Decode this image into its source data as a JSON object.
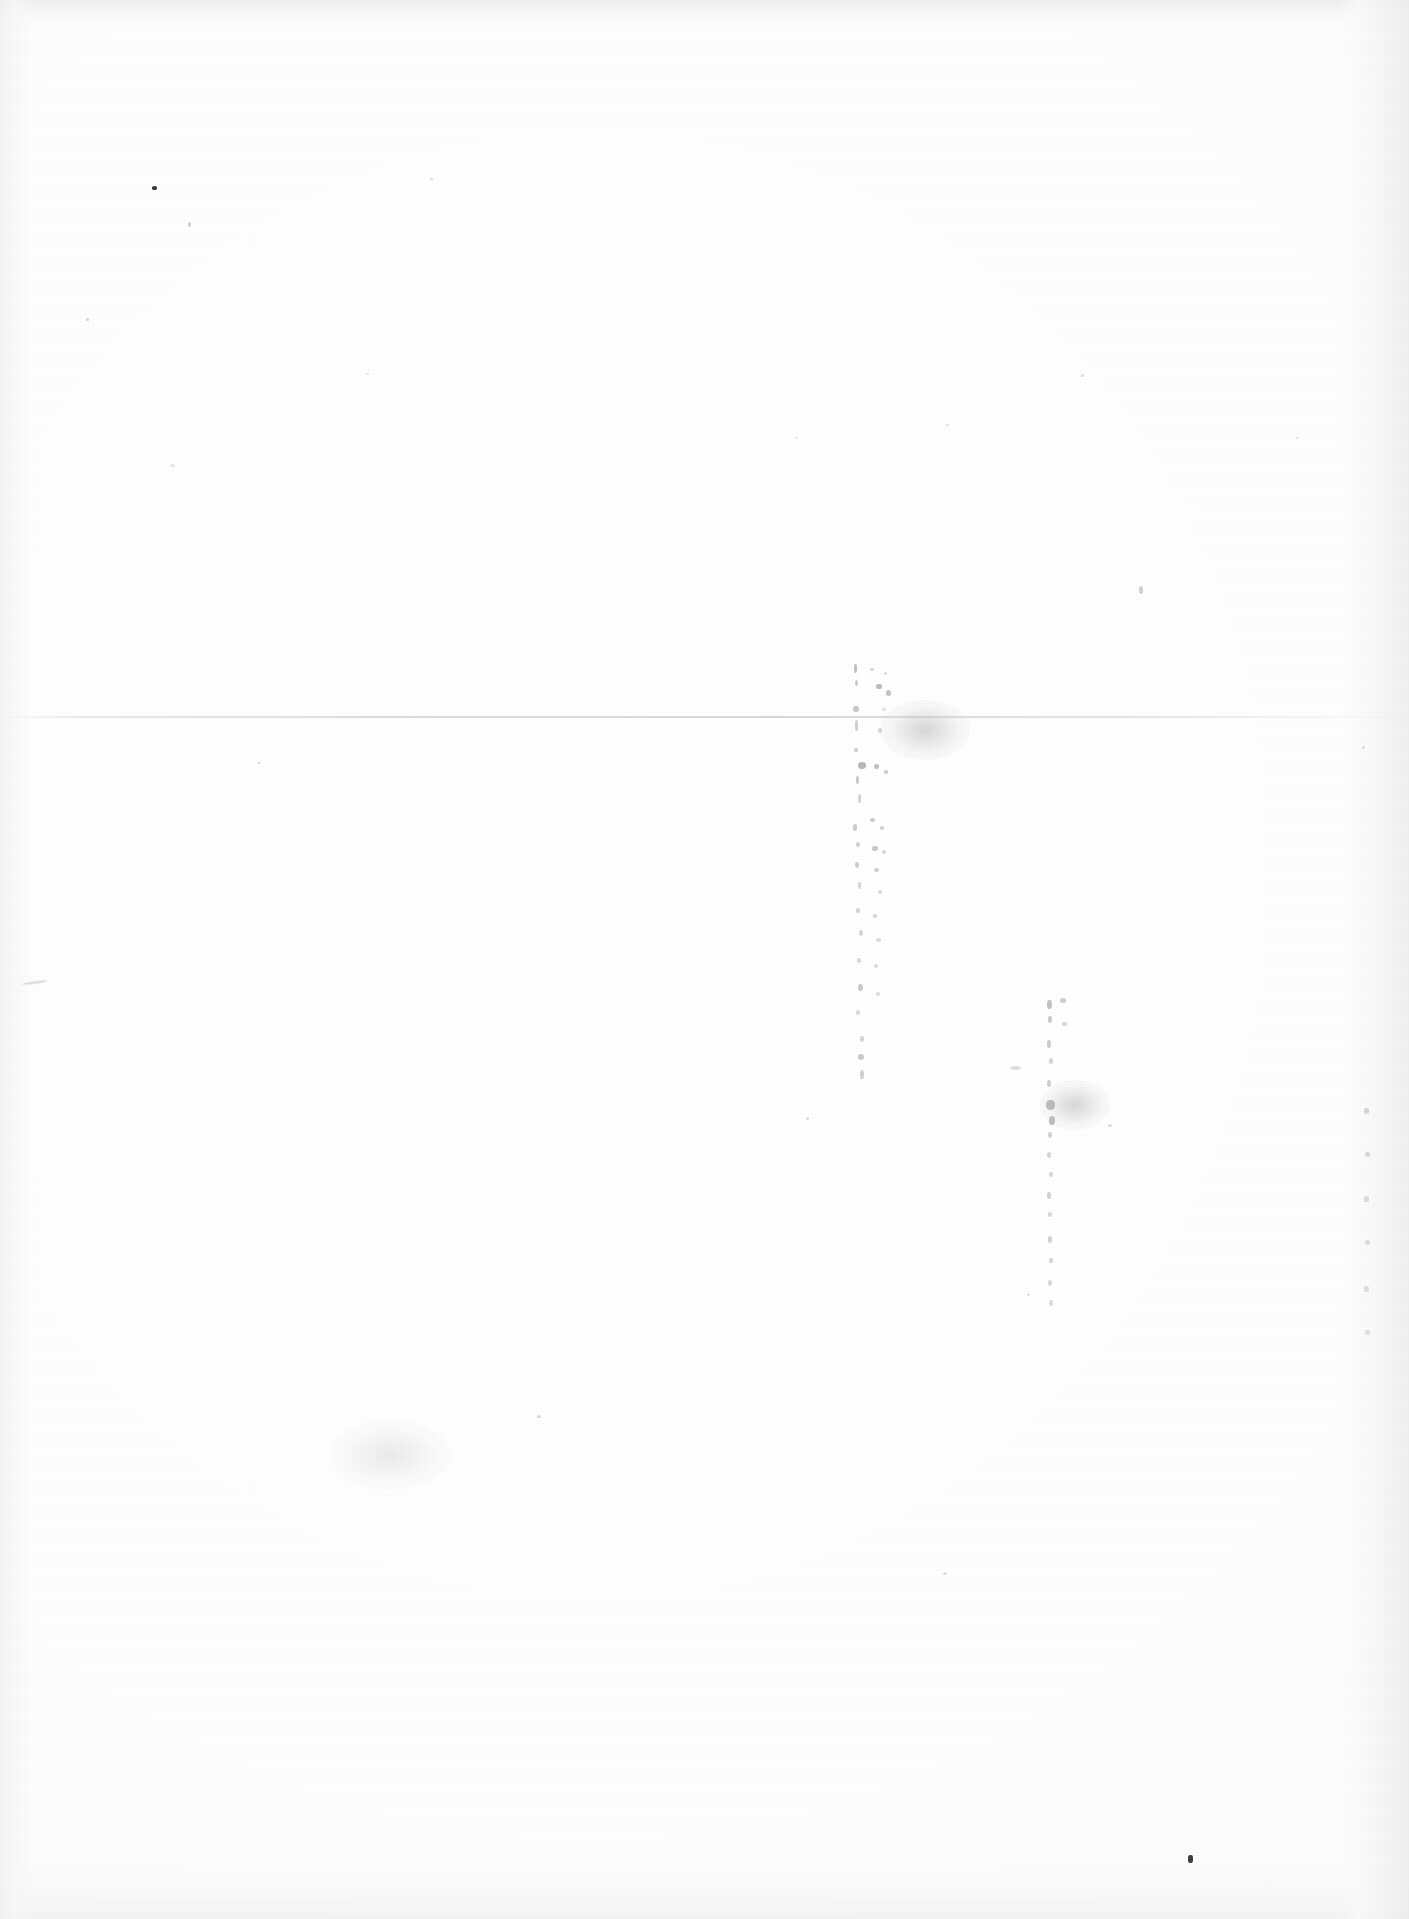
{
  "document": {
    "kind": "scanned-page",
    "description": "Blank scanned page",
    "visible_text": "",
    "page_width": 1409,
    "page_height": 1919,
    "paper_color": "#fefefe",
    "ink_color": "#3d3d40",
    "show_through_color": "#9a9a9c"
  },
  "artifacts": {
    "fold_line": {
      "y": 716,
      "label": "horizontal-crease"
    },
    "edges": {
      "top_label": "top-scan-edge",
      "bottom_label": "bottom-scan-edge",
      "left_label": "left-scan-edge",
      "right_label": "right-scan-edge"
    },
    "show_through_columns": [
      {
        "label": "show-through-column-left",
        "x": 852,
        "y": 662,
        "width": 54,
        "height": 420
      },
      {
        "label": "show-through-column-right",
        "x": 1046,
        "y": 1000,
        "width": 40,
        "height": 310
      }
    ],
    "specks": [
      {
        "x": 152,
        "y": 186,
        "w": 5,
        "h": 4
      },
      {
        "x": 188,
        "y": 222,
        "w": 3,
        "h": 5
      },
      {
        "x": 1188,
        "y": 1855,
        "w": 5,
        "h": 8
      },
      {
        "x": 86,
        "y": 318,
        "w": 3,
        "h": 3
      },
      {
        "x": 430,
        "y": 178,
        "w": 3,
        "h": 2
      },
      {
        "x": 1081,
        "y": 374,
        "w": 3,
        "h": 3
      },
      {
        "x": 946,
        "y": 424,
        "w": 3,
        "h": 2
      },
      {
        "x": 1139,
        "y": 586,
        "w": 4,
        "h": 8
      },
      {
        "x": 537,
        "y": 1415,
        "w": 4,
        "h": 3
      },
      {
        "x": 806,
        "y": 1117,
        "w": 3,
        "h": 3
      },
      {
        "x": 1108,
        "y": 1124,
        "w": 4,
        "h": 3
      },
      {
        "x": 29,
        "y": 983,
        "w": 14,
        "h": 3
      },
      {
        "x": 1010,
        "y": 1066,
        "w": 11,
        "h": 4
      },
      {
        "x": 943,
        "y": 1572,
        "w": 4,
        "h": 3
      },
      {
        "x": 366,
        "y": 373,
        "w": 3,
        "h": 2
      },
      {
        "x": 1362,
        "y": 746,
        "w": 3,
        "h": 3
      },
      {
        "x": 257,
        "y": 762,
        "w": 4,
        "h": 2
      },
      {
        "x": 1296,
        "y": 437,
        "w": 3,
        "h": 2
      },
      {
        "x": 795,
        "y": 437,
        "w": 3,
        "h": 2
      },
      {
        "x": 1027,
        "y": 1293,
        "w": 3,
        "h": 3
      },
      {
        "x": 1118,
        "y": 1123,
        "w": 3,
        "h": 3
      },
      {
        "x": 170,
        "y": 464,
        "w": 5,
        "h": 3
      }
    ]
  }
}
